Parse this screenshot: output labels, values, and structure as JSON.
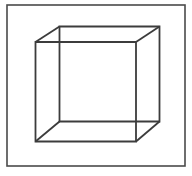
{
  "figure": {
    "type": "necker-cube-wireframe",
    "background_color": "#ffffff",
    "frame": {
      "x": 7,
      "y": 5,
      "width": 178,
      "height": 161,
      "stroke_color": "#4a4a4a",
      "stroke_width": 1.6
    },
    "cube": {
      "stroke_color": "#3c3c3c",
      "stroke_width": 1.8,
      "front_face": {
        "left": 35.5,
        "top": 42,
        "right": 136,
        "bottom": 141.5
      },
      "back_face": {
        "left": 59.5,
        "top": 26.5,
        "right": 159.5,
        "bottom": 121.5
      }
    }
  }
}
